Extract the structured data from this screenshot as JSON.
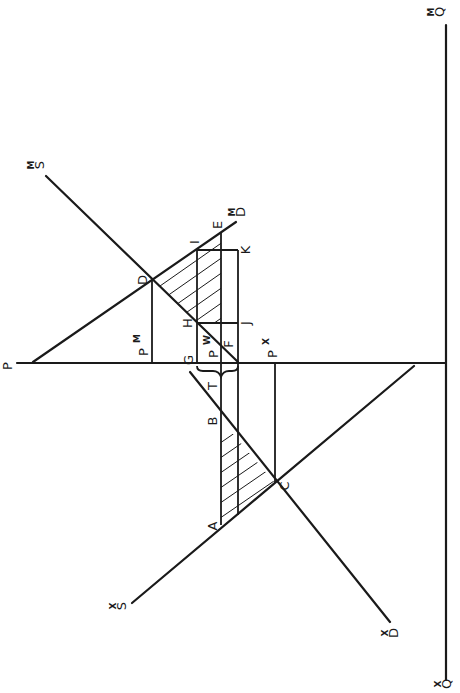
{
  "diagram": {
    "type": "two-country trade model (rotated 90°)",
    "orientation": "rotated 90 degrees clockwise; price axis horizontal, quantity axis vertical",
    "colors": {
      "ink": "#1a1a1a",
      "background": "#ffffff"
    },
    "axes": {
      "price": {
        "label": "P"
      },
      "quantity_import": {
        "label": "Q",
        "sup": "M"
      },
      "quantity_export": {
        "label": "Q",
        "sup": "X"
      }
    },
    "curves": {
      "supply_import": {
        "label": "S",
        "sup": "M"
      },
      "demand_import": {
        "label": "D",
        "sup": "M"
      },
      "supply_export": {
        "label": "S",
        "sup": "X"
      },
      "demand_export": {
        "label": "D",
        "sup": "X"
      }
    },
    "prices": {
      "import": {
        "label": "P",
        "sup": "M"
      },
      "world": {
        "label": "P",
        "sup": "W"
      },
      "export": {
        "label": "P",
        "sup": "X"
      },
      "tariff": {
        "label": "T"
      }
    },
    "points": {
      "A": "A",
      "B": "B",
      "C": "C",
      "D": "D",
      "E": "E",
      "F": "F",
      "G": "G",
      "H": "H",
      "I": "I",
      "J": "J",
      "K": "K"
    }
  }
}
